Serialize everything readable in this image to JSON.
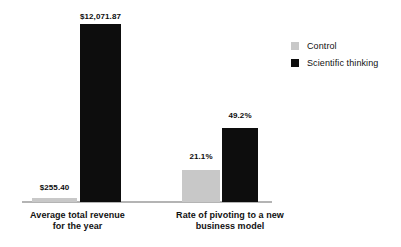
{
  "chart_data": {
    "type": "bar",
    "title": "",
    "subtitle": "",
    "xlabel": "",
    "ylabel": "",
    "grid": false,
    "legend_position": "right",
    "orientation": "vertical",
    "grouping": "grouped",
    "note": "Two independent panels with different units; each panel scaled to its own maximum.",
    "categories": [
      "Average total revenue for the year",
      "Rate of pivoting to a new business model"
    ],
    "category_lines": [
      [
        "Average total revenue",
        "for the year"
      ],
      [
        "Rate of pivoting to a new",
        "business model"
      ]
    ],
    "series": [
      {
        "name": "Control",
        "color": "#c8c8c8",
        "values": [
          255.4,
          21.1
        ],
        "labels": [
          "$255.40",
          "21.1%"
        ]
      },
      {
        "name": "Scientific thinking",
        "color": "#0d0d0d",
        "values": [
          12071.87,
          49.2
        ],
        "labels": [
          "$12,071.87",
          "49.2%"
        ]
      }
    ],
    "units": [
      "USD",
      "percent"
    ],
    "panel_axis_max": [
      12071.87,
      49.2
    ],
    "axis_color": "#b4b4b4"
  },
  "legend": {
    "items": [
      {
        "label": "Control",
        "color": "#c8c8c8"
      },
      {
        "label": "Scientific thinking",
        "color": "#0d0d0d"
      }
    ]
  }
}
